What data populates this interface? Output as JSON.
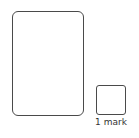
{
  "answer_area": {
    "value": ""
  },
  "mark_box": {
    "value": "",
    "label": "1 mark"
  }
}
